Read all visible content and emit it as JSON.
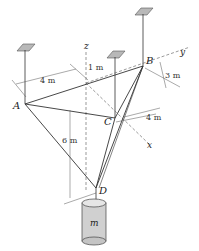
{
  "diagram": {
    "points": {
      "A": "A",
      "B": "B",
      "C": "C",
      "D": "D"
    },
    "axes": {
      "x": "x",
      "y": "y",
      "z": "z"
    },
    "dimensions": {
      "d_4m_left": "4 m",
      "d_1m": "1 m",
      "d_3m": "3 m",
      "d_4m_right": "4 m",
      "d_6m": "6 m"
    },
    "mass_label": "m",
    "colors": {
      "line": "#333333",
      "plate": "#b8b8b8",
      "cylinder": "#d4d4d4"
    }
  }
}
